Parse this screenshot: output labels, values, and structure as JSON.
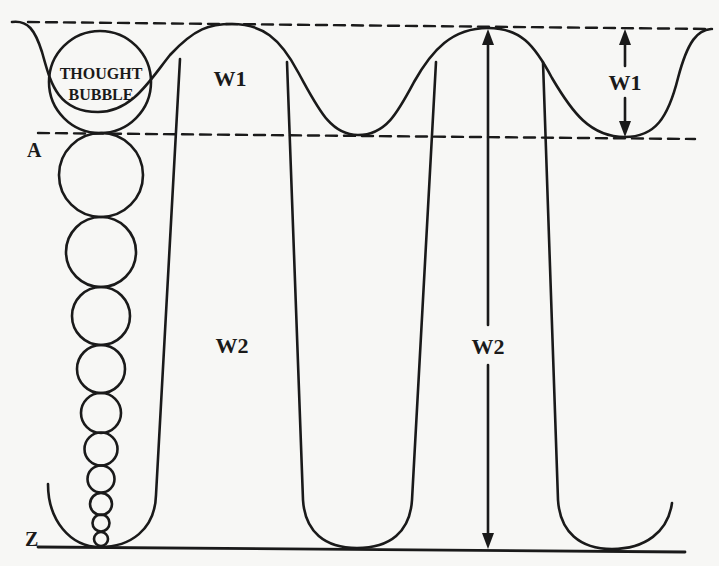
{
  "diagram": {
    "labels": {
      "bubble_line1": "THOUGHT",
      "bubble_line2": "BUBBLE",
      "level_top_marker": "A",
      "level_bottom_marker": "Z",
      "wave1_label_left": "W1",
      "wave1_label_right": "W1",
      "wave2_label_left": "W2",
      "wave2_label_right": "W2"
    },
    "colors": {
      "ink": "#1a1a1a",
      "paper": "#f7f7f5"
    }
  }
}
